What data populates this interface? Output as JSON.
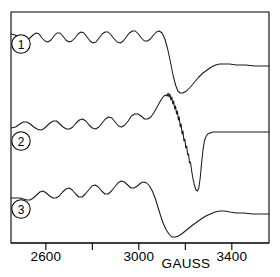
{
  "figure": {
    "type": "esr-spectrum-figure",
    "background": "#ffffff",
    "line_color": "#1a1a1a"
  },
  "axis": {
    "title": "GAUSS",
    "tick_labels": [
      "2600",
      "3000",
      "3400"
    ],
    "all_ticks": [
      2600,
      2800,
      3000,
      3200,
      3400
    ],
    "labeled_ticks": [
      2600,
      3000,
      3400
    ],
    "range": [
      2450,
      3560
    ]
  },
  "trace_labels": [
    {
      "id": "trace-1",
      "text": "1"
    },
    {
      "id": "trace-2",
      "text": "2"
    },
    {
      "id": "trace-3",
      "text": "3"
    }
  ],
  "chart_data": {
    "type": "line",
    "title": "",
    "subtitle": "",
    "xlabel": "GAUSS",
    "ylabel": "",
    "xlim": [
      2450,
      3560
    ],
    "xticks": [
      2600,
      2800,
      3000,
      3200,
      3400
    ],
    "xticklabels": [
      "2600",
      "",
      "3000",
      "",
      "3400"
    ],
    "grid": false,
    "legend": "inline-circled-numbers",
    "series": [
      {
        "name": "1",
        "label": "1",
        "baseline_y_px": 35,
        "annotation": "smooth oscillations, steep drop to minimum near 3190 G, gradual rise to high-field plateau",
        "points": [
          [
            2450,
            34
          ],
          [
            2468,
            35
          ],
          [
            2487,
            38
          ],
          [
            2503,
            40
          ],
          [
            2517,
            40
          ],
          [
            2531,
            38
          ],
          [
            2545,
            35
          ],
          [
            2558,
            33
          ],
          [
            2571,
            34
          ],
          [
            2583,
            38
          ],
          [
            2596,
            41
          ],
          [
            2609,
            42
          ],
          [
            2622,
            40
          ],
          [
            2635,
            36
          ],
          [
            2648,
            33
          ],
          [
            2661,
            33
          ],
          [
            2673,
            36
          ],
          [
            2686,
            40
          ],
          [
            2699,
            42
          ],
          [
            2712,
            41
          ],
          [
            2725,
            38
          ],
          [
            2738,
            34
          ],
          [
            2751,
            32
          ],
          [
            2764,
            33
          ],
          [
            2777,
            37
          ],
          [
            2790,
            41
          ],
          [
            2803,
            43
          ],
          [
            2816,
            42
          ],
          [
            2829,
            38
          ],
          [
            2842,
            34
          ],
          [
            2855,
            32
          ],
          [
            2868,
            32
          ],
          [
            2881,
            35
          ],
          [
            2894,
            39
          ],
          [
            2907,
            42
          ],
          [
            2920,
            43
          ],
          [
            2933,
            41
          ],
          [
            2946,
            37
          ],
          [
            2959,
            33
          ],
          [
            2972,
            31
          ],
          [
            2985,
            31
          ],
          [
            2998,
            34
          ],
          [
            3011,
            38
          ],
          [
            3024,
            41
          ],
          [
            3037,
            41
          ],
          [
            3050,
            39
          ],
          [
            3063,
            35
          ],
          [
            3076,
            32
          ],
          [
            3088,
            31
          ],
          [
            3100,
            33
          ],
          [
            3112,
            39
          ],
          [
            3124,
            49
          ],
          [
            3136,
            62
          ],
          [
            3148,
            76
          ],
          [
            3158,
            85
          ],
          [
            3168,
            91
          ],
          [
            3178,
            93
          ],
          [
            3190,
            93
          ],
          [
            3205,
            91
          ],
          [
            3222,
            87
          ],
          [
            3240,
            82
          ],
          [
            3258,
            77
          ],
          [
            3276,
            73
          ],
          [
            3294,
            70
          ],
          [
            3312,
            67
          ],
          [
            3330,
            65
          ],
          [
            3348,
            64
          ],
          [
            3366,
            64
          ],
          [
            3390,
            64
          ],
          [
            3420,
            65
          ],
          [
            3460,
            65
          ],
          [
            3500,
            66
          ],
          [
            3530,
            66
          ],
          [
            3560,
            66
          ]
        ]
      },
      {
        "name": "2",
        "label": "2",
        "baseline_y_px": 128,
        "annotation": "oscillations rising slightly, sharp peak near 3130 G with serrated descent, very deep narrow minimum near 3250 G, abrupt rise to flat plateau",
        "points": [
          [
            2450,
            128
          ],
          [
            2470,
            127
          ],
          [
            2488,
            124
          ],
          [
            2503,
            122
          ],
          [
            2518,
            122
          ],
          [
            2533,
            124
          ],
          [
            2548,
            127
          ],
          [
            2562,
            129
          ],
          [
            2576,
            130
          ],
          [
            2590,
            129
          ],
          [
            2604,
            126
          ],
          [
            2618,
            123
          ],
          [
            2632,
            121
          ],
          [
            2646,
            121
          ],
          [
            2660,
            124
          ],
          [
            2674,
            127
          ],
          [
            2688,
            129
          ],
          [
            2702,
            129
          ],
          [
            2716,
            127
          ],
          [
            2730,
            123
          ],
          [
            2744,
            120
          ],
          [
            2758,
            119
          ],
          [
            2772,
            121
          ],
          [
            2786,
            125
          ],
          [
            2800,
            128
          ],
          [
            2814,
            129
          ],
          [
            2828,
            127
          ],
          [
            2842,
            123
          ],
          [
            2856,
            119
          ],
          [
            2870,
            117
          ],
          [
            2884,
            118
          ],
          [
            2898,
            122
          ],
          [
            2912,
            126
          ],
          [
            2926,
            127
          ],
          [
            2940,
            125
          ],
          [
            2954,
            121
          ],
          [
            2968,
            116
          ],
          [
            2982,
            114
          ],
          [
            2996,
            114
          ],
          [
            3010,
            116
          ],
          [
            3024,
            119
          ],
          [
            3038,
            119
          ],
          [
            3052,
            117
          ],
          [
            3064,
            113
          ],
          [
            3076,
            108
          ],
          [
            3088,
            103
          ],
          [
            3098,
            99
          ],
          [
            3108,
            96
          ],
          [
            3116,
            95
          ],
          [
            3122,
            96
          ],
          [
            3126,
            93
          ],
          [
            3130,
            97
          ],
          [
            3134,
            94
          ],
          [
            3138,
            100
          ],
          [
            3142,
            97
          ],
          [
            3146,
            104
          ],
          [
            3150,
            101
          ],
          [
            3154,
            109
          ],
          [
            3158,
            106
          ],
          [
            3162,
            114
          ],
          [
            3166,
            111
          ],
          [
            3170,
            120
          ],
          [
            3174,
            117
          ],
          [
            3178,
            127
          ],
          [
            3182,
            124
          ],
          [
            3186,
            134
          ],
          [
            3190,
            131
          ],
          [
            3194,
            141
          ],
          [
            3198,
            139
          ],
          [
            3202,
            148
          ],
          [
            3206,
            146
          ],
          [
            3210,
            155
          ],
          [
            3214,
            154
          ],
          [
            3218,
            163
          ],
          [
            3222,
            162
          ],
          [
            3228,
            172
          ],
          [
            3234,
            180
          ],
          [
            3240,
            186
          ],
          [
            3246,
            190
          ],
          [
            3252,
            191
          ],
          [
            3258,
            188
          ],
          [
            3264,
            178
          ],
          [
            3270,
            163
          ],
          [
            3276,
            150
          ],
          [
            3282,
            141
          ],
          [
            3288,
            137
          ],
          [
            3296,
            134
          ],
          [
            3306,
            133
          ],
          [
            3320,
            132
          ],
          [
            3340,
            132
          ],
          [
            3370,
            132
          ],
          [
            3410,
            132
          ],
          [
            3460,
            132
          ],
          [
            3510,
            132
          ],
          [
            3560,
            132
          ]
        ]
      },
      {
        "name": "3",
        "label": "3",
        "baseline_y_px": 198,
        "annotation": "oscillations with upward drift, broad deep minimum near 3200 G, slow rise to high-field plateau",
        "points": [
          [
            2450,
            198
          ],
          [
            2470,
            198
          ],
          [
            2488,
            198
          ],
          [
            2504,
            199
          ],
          [
            2518,
            200
          ],
          [
            2532,
            200
          ],
          [
            2546,
            198
          ],
          [
            2560,
            195
          ],
          [
            2574,
            192
          ],
          [
            2588,
            191
          ],
          [
            2602,
            193
          ],
          [
            2616,
            196
          ],
          [
            2630,
            198
          ],
          [
            2644,
            198
          ],
          [
            2658,
            196
          ],
          [
            2672,
            192
          ],
          [
            2686,
            189
          ],
          [
            2700,
            188
          ],
          [
            2714,
            190
          ],
          [
            2728,
            194
          ],
          [
            2742,
            197
          ],
          [
            2756,
            197
          ],
          [
            2770,
            194
          ],
          [
            2784,
            190
          ],
          [
            2798,
            186
          ],
          [
            2812,
            185
          ],
          [
            2826,
            187
          ],
          [
            2840,
            191
          ],
          [
            2854,
            194
          ],
          [
            2868,
            194
          ],
          [
            2882,
            191
          ],
          [
            2896,
            187
          ],
          [
            2910,
            183
          ],
          [
            2924,
            181
          ],
          [
            2938,
            182
          ],
          [
            2952,
            185
          ],
          [
            2966,
            188
          ],
          [
            2980,
            188
          ],
          [
            2994,
            186
          ],
          [
            3008,
            183
          ],
          [
            3022,
            182
          ],
          [
            3034,
            183
          ],
          [
            3046,
            186
          ],
          [
            3058,
            191
          ],
          [
            3070,
            198
          ],
          [
            3082,
            207
          ],
          [
            3094,
            216
          ],
          [
            3106,
            224
          ],
          [
            3118,
            230
          ],
          [
            3130,
            234
          ],
          [
            3142,
            237
          ],
          [
            3156,
            237
          ],
          [
            3170,
            236
          ],
          [
            3184,
            234
          ],
          [
            3200,
            231
          ],
          [
            3216,
            228
          ],
          [
            3232,
            225
          ],
          [
            3250,
            222
          ],
          [
            3268,
            219
          ],
          [
            3288,
            216
          ],
          [
            3308,
            214
          ],
          [
            3328,
            212
          ],
          [
            3348,
            211
          ],
          [
            3368,
            211
          ],
          [
            3392,
            212
          ],
          [
            3420,
            213
          ],
          [
            3450,
            213
          ],
          [
            3490,
            214
          ],
          [
            3530,
            214
          ],
          [
            3560,
            214
          ]
        ]
      }
    ]
  }
}
